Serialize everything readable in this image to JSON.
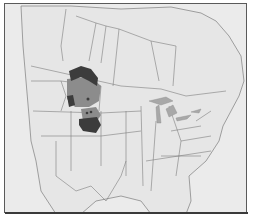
{
  "map": {
    "type": "species range map",
    "region": "North America (Canada, United States, northern Mexico)",
    "background_color": "#ebebeb",
    "frame_color": "#5a5a5a",
    "boundary_color": "#7d7d7d",
    "lake_color": "#a8a8a8",
    "legend": null,
    "labels": []
  },
  "range": {
    "colors": {
      "dark": "#3c3c3c",
      "medium": "#8c8c8c",
      "light": "#b4b4b4"
    },
    "areas": [
      {
        "shade": "dark",
        "approx_location": "northern Montana / southern Alberta–Saskatchewan"
      },
      {
        "shade": "medium",
        "approx_location": "Montana, northern Wyoming"
      },
      {
        "shade": "dark",
        "approx_location": "western Wyoming / Idaho border"
      },
      {
        "shade": "medium",
        "approx_location": "southern Wyoming, northern Colorado"
      },
      {
        "shade": "dark",
        "approx_location": "Colorado / western Kansas–Nebraska"
      }
    ]
  }
}
